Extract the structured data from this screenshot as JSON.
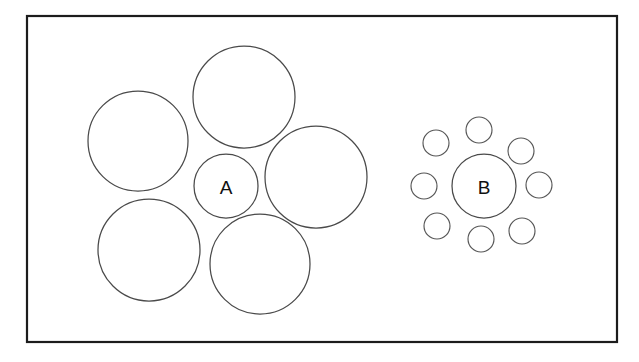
{
  "figure": {
    "type": "ebbinghaus-illusion-diagram",
    "canvas": {
      "width": 639,
      "height": 362,
      "background": "#ffffff"
    },
    "frame": {
      "name": "outer-border",
      "x": 27,
      "y": 16,
      "width": 590,
      "height": 326,
      "stroke": "#1c1c1c",
      "stroke_width": 2.2
    },
    "stroke_color": "#4a4a4a",
    "fill_color": "#ffffff",
    "groups": [
      {
        "id": "group-a",
        "label": "A",
        "label_x": 226,
        "label_y": 187,
        "target": {
          "cx": 226,
          "cy": 186,
          "r": 32
        },
        "inducers_count": 5,
        "inducers": [
          {
            "cx": 138,
            "cy": 141,
            "r": 50
          },
          {
            "cx": 244,
            "cy": 97,
            "r": 51
          },
          {
            "cx": 316,
            "cy": 177,
            "r": 51
          },
          {
            "cx": 260,
            "cy": 264,
            "r": 50
          },
          {
            "cx": 149,
            "cy": 250,
            "r": 51
          }
        ]
      },
      {
        "id": "group-b",
        "label": "B",
        "label_x": 484,
        "label_y": 187,
        "target": {
          "cx": 484,
          "cy": 186,
          "r": 32
        },
        "inducers_count": 8,
        "inducers": [
          {
            "cx": 479,
            "cy": 130,
            "r": 13
          },
          {
            "cx": 521,
            "cy": 151,
            "r": 13
          },
          {
            "cx": 539,
            "cy": 185,
            "r": 13
          },
          {
            "cx": 522,
            "cy": 231,
            "r": 13
          },
          {
            "cx": 481,
            "cy": 239,
            "r": 13
          },
          {
            "cx": 437,
            "cy": 226,
            "r": 13
          },
          {
            "cx": 424,
            "cy": 186,
            "r": 13
          },
          {
            "cx": 436,
            "cy": 143,
            "r": 13
          }
        ]
      }
    ]
  }
}
